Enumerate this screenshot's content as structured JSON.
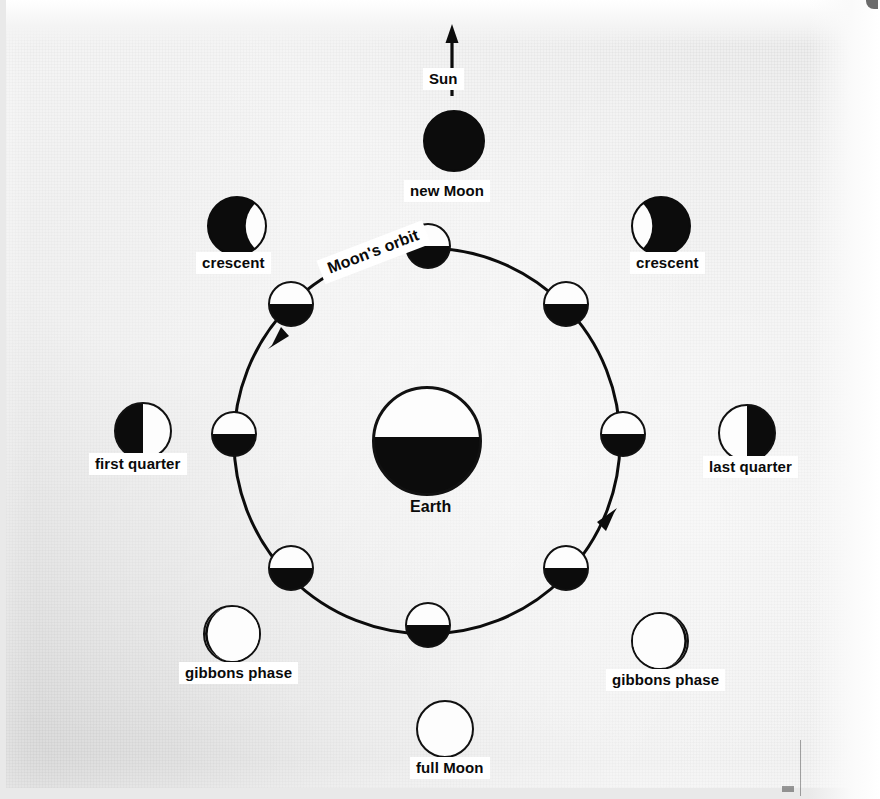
{
  "diagram": {
    "type": "astronomy-orbit-diagram",
    "colors": {
      "ink": "#0c0c0c",
      "lit": "#fdfdfd",
      "paper": "#e6e6e6",
      "label_background": "#ffffff"
    },
    "sun": {
      "label": "Sun",
      "direction": "up",
      "arrow_icon": "arrow-up-icon"
    },
    "earth": {
      "label": "Earth",
      "lit_side": "top",
      "dark_side": "bottom"
    },
    "orbit": {
      "label": "Moon's orbit",
      "direction": "counterclockwise",
      "arrow_icons": [
        "orbit-arrow-left",
        "orbit-arrow-right"
      ],
      "center_x": 427,
      "center_y": 441,
      "radius": 193
    },
    "orbit_moons": [
      {
        "name": "orbit-moon-top",
        "angle_deg": 270,
        "appearance": "half-top-lit"
      },
      {
        "name": "orbit-moon-upper-left",
        "angle_deg": 225,
        "appearance": "half-top-lit"
      },
      {
        "name": "orbit-moon-left",
        "angle_deg": 180,
        "appearance": "half-top-lit"
      },
      {
        "name": "orbit-moon-lower-left",
        "angle_deg": 135,
        "appearance": "half-top-lit"
      },
      {
        "name": "orbit-moon-bottom",
        "angle_deg": 90,
        "appearance": "half-top-lit"
      },
      {
        "name": "orbit-moon-lower-right",
        "angle_deg": 45,
        "appearance": "half-top-lit"
      },
      {
        "name": "orbit-moon-right",
        "angle_deg": 0,
        "appearance": "half-top-lit"
      },
      {
        "name": "orbit-moon-upper-right",
        "angle_deg": 315,
        "appearance": "half-top-lit"
      }
    ],
    "phase_labels": [
      {
        "name": "new-moon",
        "label": "new Moon",
        "phase": "new",
        "position": "top"
      },
      {
        "name": "crescent-waxing",
        "label": "crescent",
        "phase": "crescent-lit-right",
        "position": "upper-left"
      },
      {
        "name": "crescent-waning",
        "label": "crescent",
        "phase": "crescent-lit-left",
        "position": "upper-right"
      },
      {
        "name": "first-quarter",
        "label": "first quarter",
        "phase": "half-lit-right",
        "position": "left"
      },
      {
        "name": "last-quarter",
        "label": "last quarter",
        "phase": "half-lit-left",
        "position": "right"
      },
      {
        "name": "gibbous-waxing",
        "label": "gibbons phase",
        "phase": "gibbous-dark-left",
        "position": "lower-left"
      },
      {
        "name": "gibbous-waning",
        "label": "gibbons phase",
        "phase": "gibbous-dark-right",
        "position": "lower-right"
      },
      {
        "name": "full-moon",
        "label": "full Moon",
        "phase": "full",
        "position": "bottom"
      }
    ]
  }
}
